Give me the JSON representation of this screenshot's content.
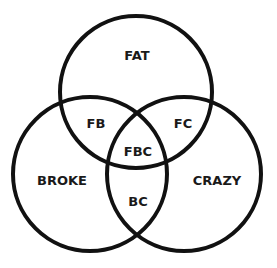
{
  "diagram": {
    "type": "venn-3-set",
    "colors": {
      "stroke": "#111111",
      "text": "#1a1a1a",
      "background": "#ffffff"
    },
    "sets": [
      {
        "id": "F",
        "label": "FAT",
        "cx": 136,
        "cy": 92,
        "r": 76
      },
      {
        "id": "B",
        "label": "BROKE",
        "cx": 90,
        "cy": 174,
        "r": 77
      },
      {
        "id": "C",
        "label": "CRAZY",
        "cx": 184,
        "cy": 174,
        "r": 77
      }
    ],
    "regions": {
      "fat": {
        "label": "FAT",
        "x": 137,
        "y": 55
      },
      "fb": {
        "label": "FB",
        "x": 96,
        "y": 123
      },
      "fc": {
        "label": "FC",
        "x": 183,
        "y": 123
      },
      "fbc": {
        "label": "FBC",
        "x": 138,
        "y": 151
      },
      "broke": {
        "label": "BROKE",
        "x": 62,
        "y": 180
      },
      "crazy": {
        "label": "CRAZY",
        "x": 217,
        "y": 180
      },
      "bc": {
        "label": "BC",
        "x": 138,
        "y": 201
      }
    }
  }
}
